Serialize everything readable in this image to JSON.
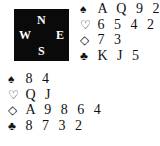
{
  "compass": {
    "north": "N",
    "west": "W",
    "east": "E",
    "south": "S"
  },
  "hands": {
    "north": {
      "spades": {
        "symbol": "♠",
        "cards": "A Q 9 2"
      },
      "hearts": {
        "symbol": "♡",
        "cards": "6 5 4 2"
      },
      "diamonds": {
        "symbol": "◇",
        "cards": "7 3"
      },
      "clubs": {
        "symbol": "♣",
        "cards": "K J 5"
      }
    },
    "south": {
      "spades": {
        "symbol": "♠",
        "cards": "8 4"
      },
      "hearts": {
        "symbol": "♡",
        "cards": "Q J"
      },
      "diamonds": {
        "symbol": "◇",
        "cards": "A 9 8 6 4"
      },
      "clubs": {
        "symbol": "♣",
        "cards": "8 7 3 2"
      }
    }
  }
}
